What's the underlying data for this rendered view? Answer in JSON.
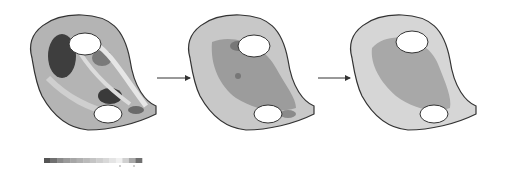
{
  "figure": {
    "panels": [
      {
        "id": "stage-1",
        "label": ""
      },
      {
        "id": "stage-2",
        "label": ""
      },
      {
        "id": "stage-3",
        "label": ""
      }
    ],
    "arrows": 2,
    "colorbar": {
      "cells": [
        "#555555",
        "#707070",
        "#8a8a8a",
        "#9a9a9a",
        "#a6a6a6",
        "#b0b0b0",
        "#bababa",
        "#c4c4c4",
        "#cecece",
        "#d8d8d8",
        "#e4e4e4",
        "#f0f0f0",
        "#d0d0d0",
        "#a8a8a8",
        "#707070"
      ],
      "ticks": 2
    }
  }
}
